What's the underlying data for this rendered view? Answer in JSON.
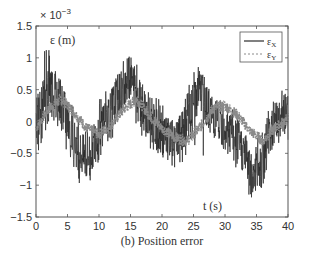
{
  "chart_data": {
    "type": "line",
    "title": "",
    "caption": "(b) Position error",
    "xlabel": "t (s)",
    "ylabel": "ε (m)",
    "y_multiplier": "× 10^-3",
    "xlim": [
      0,
      40
    ],
    "ylim": [
      -1.5,
      1.5
    ],
    "xticks": [
      0,
      5,
      10,
      15,
      20,
      25,
      30,
      35,
      40
    ],
    "yticks": [
      -1.5,
      -1,
      -0.5,
      0,
      0.5,
      1,
      1.5
    ],
    "xtick_labels": [
      "0",
      "5",
      "10",
      "15",
      "20",
      "25",
      "30",
      "35",
      "40"
    ],
    "ytick_labels": [
      "−1.5",
      "−1",
      "−0.5",
      "0",
      "0.5",
      "1",
      "1.5"
    ],
    "grid": false,
    "legend_position": "upper right",
    "legend": [
      "εX",
      "εY"
    ],
    "series": [
      {
        "name": "εX",
        "style": "solid",
        "color": "#2a2a2a",
        "x": [
          0,
          1,
          2,
          3,
          4,
          5,
          6,
          7,
          8,
          9,
          10,
          11,
          12,
          13,
          14,
          15,
          16,
          17,
          18,
          19,
          20,
          21,
          22,
          23,
          24,
          25,
          26,
          27,
          28,
          29,
          30,
          31,
          32,
          33,
          34,
          35,
          36,
          37,
          38,
          39,
          40
        ],
        "values_mean": [
          -0.1,
          0.3,
          0.6,
          0.5,
          0.3,
          0.0,
          -0.3,
          -0.5,
          -0.6,
          -0.4,
          -0.1,
          0.1,
          0.2,
          0.4,
          0.6,
          0.7,
          0.5,
          0.2,
          0.0,
          -0.1,
          -0.2,
          -0.3,
          -0.4,
          -0.2,
          0.0,
          0.3,
          0.5,
          0.3,
          0.1,
          0.0,
          -0.1,
          -0.2,
          -0.3,
          -0.5,
          -0.7,
          -0.8,
          -0.5,
          -0.2,
          0.0,
          0.1,
          0.1
        ],
        "values_max": [
          0.3,
          1.1,
          1.15,
          0.95,
          0.7,
          0.4,
          0.2,
          0.0,
          -0.1,
          0.2,
          0.4,
          0.5,
          0.6,
          0.8,
          1.0,
          1.05,
          0.9,
          0.6,
          0.5,
          0.4,
          0.3,
          0.1,
          0.0,
          0.2,
          0.5,
          0.8,
          1.05,
          0.6,
          0.4,
          0.4,
          0.3,
          0.3,
          0.1,
          -0.1,
          -0.2,
          -0.3,
          0.0,
          0.2,
          0.4,
          0.5,
          0.4
        ],
        "values_min": [
          -0.6,
          -0.4,
          0.0,
          0.0,
          -0.2,
          -0.5,
          -0.8,
          -1.0,
          -1.1,
          -0.9,
          -0.6,
          -0.4,
          -0.3,
          -0.1,
          0.1,
          0.2,
          -0.1,
          -0.3,
          -0.5,
          -0.6,
          -0.7,
          -0.8,
          -0.8,
          -0.7,
          -0.5,
          -0.3,
          -1.1,
          -0.2,
          -0.3,
          -0.4,
          -0.5,
          -0.7,
          -0.8,
          -1.0,
          -1.2,
          -1.3,
          -1.0,
          -0.7,
          -0.4,
          -0.3,
          -0.3
        ]
      },
      {
        "name": "εY",
        "style": "dashed",
        "color": "#8a8a8a",
        "x": [
          0,
          2,
          4,
          6,
          8,
          10,
          12,
          14,
          16,
          18,
          20,
          22,
          24,
          26,
          28,
          30,
          32,
          34,
          36,
          38,
          40
        ],
        "values": [
          -0.1,
          0.2,
          0.35,
          0.15,
          -0.1,
          -0.2,
          -0.05,
          0.2,
          0.35,
          0.1,
          -0.1,
          -0.25,
          -0.3,
          -0.1,
          0.2,
          0.25,
          0.1,
          -0.15,
          -0.3,
          -0.1,
          0.05
        ]
      }
    ],
    "units": {
      "x": "s",
      "y": "m"
    }
  }
}
